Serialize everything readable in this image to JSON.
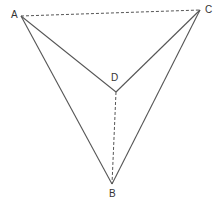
{
  "diagram": {
    "type": "geometry-figure",
    "points": {
      "A": {
        "label": "A",
        "x": 21,
        "y": 16,
        "label_x": 11,
        "label_y": 18
      },
      "B": {
        "label": "B",
        "x": 112,
        "y": 184,
        "label_x": 109,
        "label_y": 197
      },
      "C": {
        "label": "C",
        "x": 200,
        "y": 10,
        "label_x": 205,
        "label_y": 13
      },
      "D": {
        "label": "D",
        "x": 116,
        "y": 92,
        "label_x": 111,
        "label_y": 81
      }
    },
    "edges": [
      {
        "from": "A",
        "to": "B",
        "style": "solid"
      },
      {
        "from": "C",
        "to": "B",
        "style": "solid"
      },
      {
        "from": "A",
        "to": "D",
        "style": "solid"
      },
      {
        "from": "C",
        "to": "D",
        "style": "solid"
      },
      {
        "from": "A",
        "to": "C",
        "style": "dashed"
      },
      {
        "from": "D",
        "to": "B",
        "style": "dashed"
      }
    ],
    "colors": {
      "line": "#555555",
      "label": "#333333",
      "background": "#ffffff"
    }
  }
}
